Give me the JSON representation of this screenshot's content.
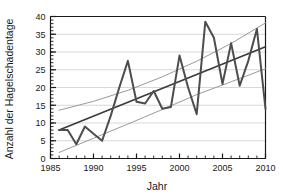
{
  "chart_data": {
    "type": "line",
    "title": "",
    "xlabel": "Jahr",
    "ylabel": "Anzahl der Hagelschadentage",
    "xlim": [
      1985,
      2010
    ],
    "ylim": [
      0,
      40
    ],
    "grid": true,
    "legend": "none",
    "xticks": [
      1985,
      1990,
      1995,
      2000,
      2005,
      2010
    ],
    "xtick_labels": [
      "1985",
      "1990",
      "1995",
      "2000",
      "2005",
      "2010"
    ],
    "xminor_step": 1,
    "yticks": [
      0,
      5,
      10,
      15,
      20,
      25,
      30,
      35,
      40
    ],
    "ytick_labels": [
      "0",
      "5",
      "10",
      "15",
      "20",
      "25",
      "30",
      "35",
      "40"
    ],
    "x": [
      1986,
      1987,
      1988,
      1989,
      1990,
      1991,
      1992,
      1993,
      1994,
      1995,
      1996,
      1997,
      1998,
      1999,
      2000,
      2001,
      2002,
      2003,
      2004,
      2005,
      2006,
      2007,
      2008,
      2009,
      2010
    ],
    "series": [
      {
        "name": "Anzahl der Hagelschadentage",
        "role": "observed",
        "color": "#4d4d4d",
        "width": 2.0,
        "values": [
          8,
          8,
          4,
          9,
          7,
          5,
          12,
          20,
          27.5,
          16,
          15.5,
          19,
          14,
          14.5,
          29,
          20,
          12.5,
          38.5,
          34,
          21,
          32.5,
          20.5,
          27.5,
          36.5,
          14
        ]
      },
      {
        "name": "Lineare Trendgerade",
        "role": "trend",
        "color": "#3a3a3a",
        "width": 1.6,
        "x": [
          1986,
          2010
        ],
        "values": [
          8.0,
          31.5
        ]
      },
      {
        "name": "Oberes Konfidenzband",
        "role": "confidence-upper",
        "color": "#9a9a9a",
        "width": 1.0,
        "x": [
          1986,
          1990,
          1994,
          1998,
          2002,
          2006,
          2010
        ],
        "values": [
          13.6,
          16.1,
          19.2,
          23.0,
          27.4,
          32.4,
          38.2
        ]
      },
      {
        "name": "Unteres Konfidenzband",
        "role": "confidence-lower",
        "color": "#9a9a9a",
        "width": 1.0,
        "x": [
          1986,
          1990,
          1994,
          1998,
          2002,
          2006,
          2010
        ],
        "values": [
          1.7,
          5.7,
          9.7,
          13.8,
          18.0,
          21.6,
          25.3
        ]
      }
    ],
    "colors": {
      "observed": "#4d4d4d",
      "trend": "#3a3a3a",
      "confidence": "#9a9a9a",
      "grid": "#d8d8d8",
      "axis": "#1a1a1a",
      "background": "#ffffff"
    }
  }
}
